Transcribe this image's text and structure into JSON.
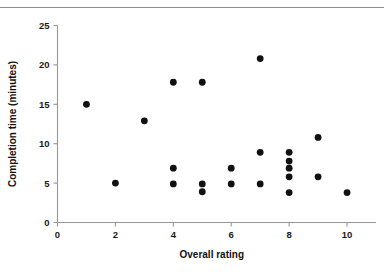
{
  "figure": {
    "top_rule": true,
    "clipped_caption": ""
  },
  "chart_data": {
    "type": "scatter",
    "title": "",
    "xlabel": "Overall rating",
    "ylabel": "Completion time (minutes)",
    "xlim": [
      0,
      11
    ],
    "ylim": [
      0,
      25
    ],
    "xticks": [
      0,
      2,
      4,
      6,
      8,
      10
    ],
    "xtick_labels": [
      "0",
      "2",
      "4",
      "6",
      "8",
      "10"
    ],
    "yticks": [
      0,
      5,
      10,
      15,
      20,
      25
    ],
    "ytick_labels": [
      "0",
      "5",
      "10",
      "15",
      "20",
      "25"
    ],
    "grid": false,
    "legend": null,
    "marker": "filled-circle",
    "marker_color": "#111111",
    "points": [
      {
        "x": 1,
        "y": 15.0
      },
      {
        "x": 2,
        "y": 5.0
      },
      {
        "x": 3,
        "y": 12.9
      },
      {
        "x": 4,
        "y": 17.8
      },
      {
        "x": 4,
        "y": 6.9
      },
      {
        "x": 4,
        "y": 4.9
      },
      {
        "x": 5,
        "y": 17.8
      },
      {
        "x": 5,
        "y": 4.9
      },
      {
        "x": 5,
        "y": 3.9
      },
      {
        "x": 6,
        "y": 6.9
      },
      {
        "x": 6,
        "y": 4.9
      },
      {
        "x": 7,
        "y": 20.8
      },
      {
        "x": 7,
        "y": 8.9
      },
      {
        "x": 7,
        "y": 4.9
      },
      {
        "x": 8,
        "y": 8.9
      },
      {
        "x": 8,
        "y": 7.8
      },
      {
        "x": 8,
        "y": 6.9
      },
      {
        "x": 8,
        "y": 5.8
      },
      {
        "x": 8,
        "y": 3.8
      },
      {
        "x": 9,
        "y": 10.8
      },
      {
        "x": 9,
        "y": 5.8
      },
      {
        "x": 10,
        "y": 3.8
      }
    ]
  }
}
